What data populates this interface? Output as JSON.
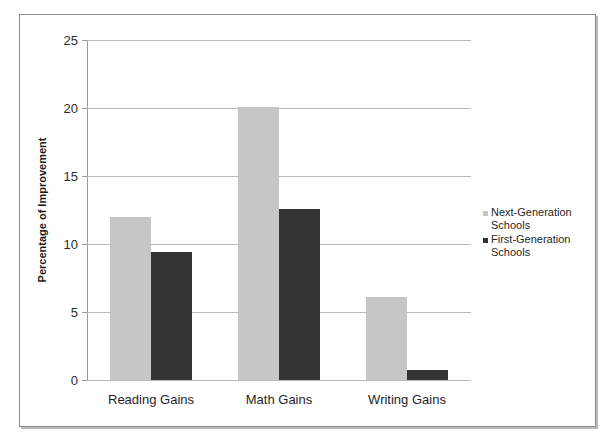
{
  "chart_data": {
    "type": "bar",
    "title": "",
    "xlabel": "",
    "ylabel": "Percentage of Improvement",
    "categories": [
      "Reading Gains",
      "Math Gains",
      "Writing Gains"
    ],
    "series": [
      {
        "name": "Next-Generation Schools",
        "color": "#c6c6c6",
        "values": [
          12.0,
          20.1,
          6.1
        ]
      },
      {
        "name": "First-Generation Schools",
        "color": "#333333",
        "values": [
          9.4,
          12.6,
          0.7
        ]
      }
    ],
    "ylim": [
      0,
      25
    ],
    "yticks": [
      0,
      5,
      10,
      15,
      20,
      25
    ],
    "ytick_labels": [
      "0",
      "5",
      "10",
      "15",
      "20",
      "25"
    ],
    "grid": true,
    "legend_position": "right"
  },
  "style": {
    "series_colors": [
      "#c6c6c6",
      "#333333"
    ],
    "gridline_color": "#b9b9b9",
    "axis_color": "#9a9a9a",
    "frame_color": "#8d8d8d",
    "background": "#ffffff",
    "text_color": "#1f1f1f"
  }
}
